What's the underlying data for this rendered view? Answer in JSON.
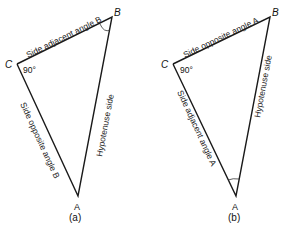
{
  "figures": [
    {
      "caption": "(a)",
      "vertices": {
        "A": "A",
        "B": "B",
        "C": "C"
      },
      "right_angle_label": "90°",
      "marked_angle": "B",
      "sides": {
        "CB": "Side adjacent angle B",
        "CA": "Side opposite angle B",
        "BA": "Hypotenuse side"
      }
    },
    {
      "caption": "(b)",
      "vertices": {
        "A": "A",
        "B": "B",
        "C": "C"
      },
      "right_angle_label": "90°",
      "marked_angle": "A",
      "sides": {
        "CB": "Side opposite angle A",
        "CA": "Side adjacent angle A",
        "BA": "Hypotenuse side"
      }
    }
  ]
}
